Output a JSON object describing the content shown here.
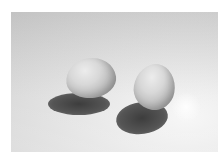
{
  "image": {
    "description": "Black-and-white photograph of two eggs casting shadows on a light surface",
    "subjects": [
      "egg-left",
      "egg-right"
    ],
    "palette": {
      "background": "#ffffff",
      "surface": "#d8d8d8",
      "shadow": "#444444",
      "egg_highlight": "#ececec",
      "egg_shade": "#8a8a8a"
    }
  }
}
